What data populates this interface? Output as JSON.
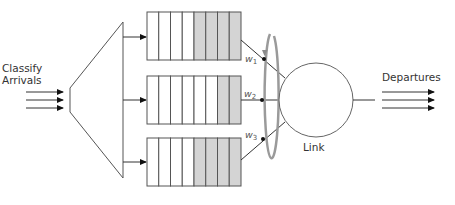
{
  "diagram": {
    "labels": {
      "classify_line1": "Classify",
      "classify_line2": "Arrivals",
      "departures": "Departures",
      "link": "Link"
    },
    "queues": [
      {
        "name": "queue-1",
        "cells": 8,
        "filled": 4,
        "weight_label": "w",
        "weight_sub": "1"
      },
      {
        "name": "queue-2",
        "cells": 8,
        "filled": 2,
        "weight_label": "w",
        "weight_sub": "2"
      },
      {
        "name": "queue-3",
        "cells": 8,
        "filled": 4,
        "weight_label": "w",
        "weight_sub": "3"
      }
    ],
    "colors": {
      "line": "#333333",
      "queue_fill": "#d4d4d4",
      "scheduler_ring": "#9a9a9a",
      "background": "#ffffff"
    }
  }
}
